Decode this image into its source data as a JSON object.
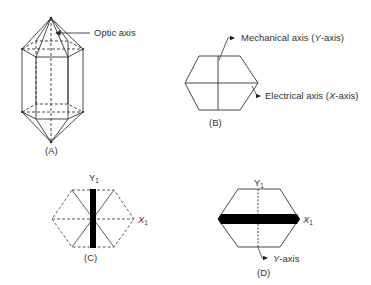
{
  "figure": {
    "panel_a": {
      "label": "(A)",
      "annotation": "Optic axis"
    },
    "panel_b": {
      "label": "(B)",
      "mechanical_axis": {
        "prefix": "Mechanical axis (",
        "letter": "Y",
        "suffix": "-axis)"
      },
      "electrical_axis": {
        "prefix": "Electrical axis (",
        "letter": "X",
        "suffix": "-axis)"
      }
    },
    "panel_c": {
      "label": "(C)",
      "y_axis": {
        "letter": "Y",
        "sub": "1"
      },
      "x_axis": {
        "letter": "X",
        "sub": "1"
      }
    },
    "panel_d": {
      "label": "(D)",
      "y_axis": {
        "letter": "Y",
        "sub": "1"
      },
      "x_axis": {
        "letter": "X",
        "sub": "1"
      },
      "annotation": {
        "letter": "Y",
        "suffix": "-axis"
      }
    },
    "colors": {
      "line": "#333333",
      "bar": "#000000",
      "background": "#ffffff"
    }
  }
}
